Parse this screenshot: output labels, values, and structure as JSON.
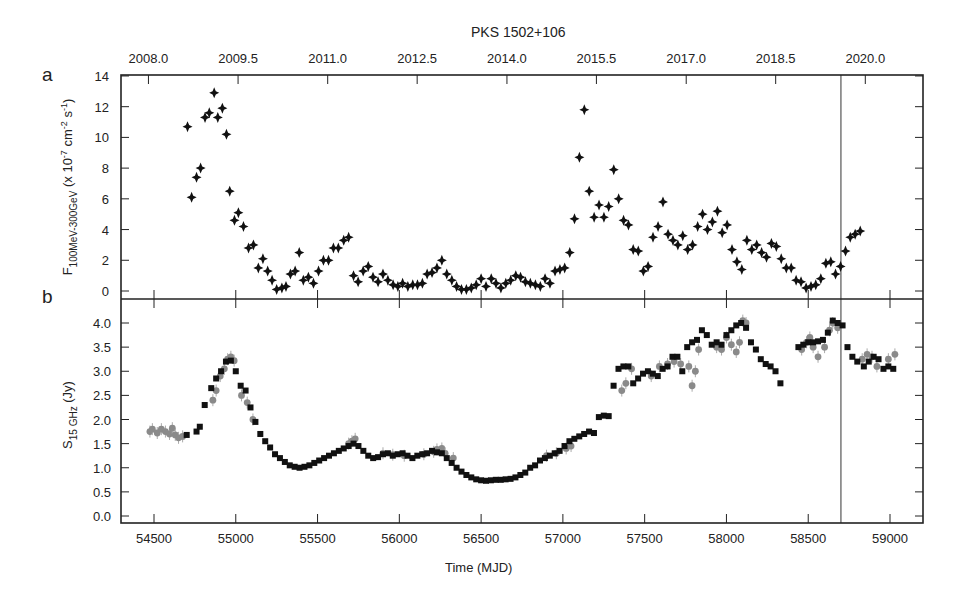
{
  "chart_data": [
    {
      "type": "scatter",
      "panel_label": "a",
      "title": "PKS 1502+106",
      "xlabel": "Time (MJD)",
      "ylabel": "F100MeV-300GeV (x 10^-7 cm^-2 s^-1)",
      "ylabel_main": "F",
      "ylabel_sub": "100MeV-300GeV",
      "ylabel_rest": " (x 10",
      "ylabel_exp1": "-7",
      "ylabel_mid": " cm",
      "ylabel_exp2": "-2",
      "ylabel_mid2": " s",
      "ylabel_exp3": "-1",
      "ylabel_end": ")",
      "ylim": [
        -0.5,
        14
      ],
      "yticks": [
        0,
        2,
        4,
        6,
        8,
        10,
        12,
        14
      ],
      "xlim": [
        54300,
        59220
      ],
      "top_axis_ticks": [
        "2008.0",
        "2009.5",
        "2011.0",
        "2012.5",
        "2014.0",
        "2015.5",
        "2017.0",
        "2018.5",
        "2020.0"
      ],
      "top_axis_tick_mjd": [
        54466,
        55014,
        55562,
        56109,
        56658,
        57205,
        57754,
        58301,
        58849
      ],
      "marker": "four-point star, black",
      "grid": false,
      "vline_mjd": 58700,
      "series": [
        {
          "name": "Fermi-LAT gamma-ray flux",
          "color": "#111111",
          "x": [
            54705,
            54730,
            54760,
            54785,
            54812,
            54838,
            54868,
            54890,
            54918,
            54943,
            54963,
            54992,
            55016,
            55047,
            55078,
            55108,
            55138,
            55166,
            55195,
            55222,
            55250,
            55282,
            55307,
            55334,
            55363,
            55388,
            55413,
            55444,
            55475,
            55506,
            55536,
            55567,
            55597,
            55627,
            55660,
            55690,
            55720,
            55748,
            55779,
            55810,
            55839,
            55870,
            55900,
            55930,
            55962,
            55991,
            56020,
            56052,
            56082,
            56111,
            56141,
            56170,
            56200,
            56230,
            56260,
            56290,
            56321,
            56350,
            56380,
            56410,
            56440,
            56470,
            56500,
            56530,
            56562,
            56591,
            56621,
            56651,
            56681,
            56712,
            56741,
            56771,
            56801,
            56832,
            56862,
            56891,
            56921,
            56952,
            56982,
            57011,
            57042,
            57071,
            57101,
            57131,
            57161,
            57191,
            57221,
            57251,
            57280,
            57311,
            57341,
            57371,
            57401,
            57430,
            57461,
            57492,
            57521,
            57551,
            57582,
            57612,
            57643,
            57673,
            57703,
            57733,
            57763,
            57793,
            57824,
            57854,
            57884,
            57914,
            57945,
            57974,
            58004,
            58034,
            58064,
            58094,
            58125,
            58155,
            58185,
            58215,
            58245,
            58275,
            58305,
            58335,
            58366,
            58396,
            58426,
            58456,
            58487,
            58517,
            58546,
            58577,
            58608,
            58638,
            58667,
            58698,
            58728,
            58757,
            58787,
            58818,
            58849,
            58878,
            58908,
            58938,
            58969,
            58999,
            59029
          ],
          "y": [
            10.7,
            6.1,
            7.4,
            8.0,
            11.3,
            11.6,
            12.9,
            11.3,
            11.9,
            10.2,
            6.5,
            4.6,
            5.1,
            4.2,
            2.8,
            3.0,
            1.5,
            2.1,
            1.3,
            0.7,
            0.1,
            0.2,
            0.3,
            1.1,
            1.3,
            2.5,
            0.7,
            0.9,
            0.5,
            1.3,
            2.0,
            2.0,
            2.8,
            2.8,
            3.3,
            3.5,
            1.0,
            0.6,
            1.3,
            1.6,
            0.9,
            0.6,
            1.1,
            0.7,
            0.4,
            0.3,
            0.5,
            0.3,
            0.4,
            0.4,
            0.5,
            1.1,
            1.2,
            1.5,
            2.0,
            1.1,
            0.7,
            0.3,
            0.1,
            0.1,
            0.2,
            0.4,
            0.8,
            0.3,
            0.8,
            0.5,
            0.2,
            0.5,
            0.7,
            1.0,
            0.9,
            0.6,
            0.5,
            0.4,
            0.3,
            0.8,
            0.5,
            1.3,
            1.4,
            1.5,
            2.5,
            4.7,
            8.7,
            11.8,
            6.5,
            4.8,
            5.6,
            4.8,
            5.5,
            7.9,
            6.0,
            4.6,
            4.3,
            2.7,
            2.6,
            1.3,
            1.6,
            3.5,
            4.2,
            5.8,
            3.7,
            3.3,
            3.0,
            3.6,
            2.7,
            3.0,
            4.2,
            5.0,
            4.0,
            4.5,
            5.2,
            3.8,
            4.3,
            2.7,
            1.9,
            1.4,
            3.3,
            2.7,
            3.0,
            2.5,
            2.2,
            3.1,
            2.9,
            2.1,
            1.5,
            1.5,
            0.7,
            0.6,
            0.2,
            0.3,
            0.4,
            0.8,
            1.8,
            1.9,
            1.1,
            1.6,
            2.6,
            3.5,
            3.7,
            3.9
          ]
        }
      ]
    },
    {
      "type": "scatter",
      "panel_label": "b",
      "xlabel": "Time (MJD)",
      "ylabel": "S15 GHz (Jy)",
      "ylabel_main": "S",
      "ylabel_sub": "15 GHz",
      "ylabel_rest": " (Jy)",
      "ylim": [
        -0.15,
        4.45
      ],
      "yticks": [
        0.0,
        0.5,
        1.0,
        1.5,
        2.0,
        2.5,
        3.0,
        3.5,
        4.0
      ],
      "ytick_labels": [
        "0.0",
        "0.5",
        "1.0",
        "1.5",
        "2.0",
        "2.5",
        "3.0",
        "3.5",
        "4.0"
      ],
      "xlim": [
        54300,
        59220
      ],
      "xticks": [
        54500,
        55000,
        55500,
        56000,
        56500,
        57000,
        57500,
        58000,
        58500,
        59000
      ],
      "marker": "square (black) and circle (grey)",
      "grid": false,
      "vline_mjd": 58700,
      "series": [
        {
          "name": "OVRO 40m (grey circles)",
          "color": "#8a8a8a",
          "x": [
            54475,
            54490,
            54520,
            54545,
            54570,
            54595,
            54612,
            54630,
            54650,
            54675,
            54860,
            54880,
            54905,
            54930,
            54950,
            54970,
            54990,
            55035,
            55070,
            55105,
            55690,
            55710,
            55730,
            55900,
            55960,
            56030,
            56150,
            56210,
            56230,
            56260,
            56280,
            56330,
            56900,
            56960,
            57020,
            57050,
            57360,
            57385,
            57420,
            57540,
            57590,
            57640,
            57680,
            57720,
            57770,
            57790,
            57810,
            57830,
            57940,
            57970,
            58000,
            58030,
            58060,
            58080,
            58100,
            58120,
            58460,
            58490,
            58510,
            58530,
            58560,
            58600,
            58630,
            58650,
            58680,
            58830,
            58860,
            58890,
            58920,
            58990,
            59030
          ],
          "y": [
            1.75,
            1.8,
            1.72,
            1.8,
            1.75,
            1.7,
            1.82,
            1.68,
            1.62,
            1.65,
            2.4,
            2.6,
            2.9,
            3.05,
            3.25,
            3.3,
            3.22,
            2.5,
            2.35,
            2.0,
            1.5,
            1.55,
            1.6,
            1.3,
            1.27,
            1.25,
            1.28,
            1.33,
            1.38,
            1.4,
            1.3,
            1.2,
            1.25,
            1.3,
            1.4,
            1.45,
            2.6,
            2.75,
            3.05,
            2.9,
            3.1,
            3.15,
            3.2,
            3.15,
            3.1,
            2.7,
            3.0,
            3.45,
            3.5,
            3.45,
            3.7,
            3.55,
            3.4,
            3.6,
            4.05,
            4.0,
            3.45,
            3.6,
            3.7,
            3.5,
            3.3,
            3.5,
            3.85,
            4.0,
            3.9,
            3.25,
            3.35,
            3.3,
            3.1,
            3.25,
            3.35
          ]
        },
        {
          "name": "OVRO 40m (black squares)",
          "color": "#111111",
          "x": [
            54700,
            54760,
            54780,
            54810,
            54850,
            54880,
            54910,
            54940,
            54970,
            55000,
            55030,
            55060,
            55090,
            55120,
            55150,
            55180,
            55210,
            55240,
            55270,
            55300,
            55330,
            55360,
            55390,
            55420,
            55450,
            55480,
            55510,
            55540,
            55570,
            55600,
            55630,
            55660,
            55690,
            55720,
            55750,
            55780,
            55810,
            55840,
            55870,
            55900,
            55930,
            55960,
            55990,
            56020,
            56050,
            56080,
            56110,
            56140,
            56170,
            56200,
            56230,
            56260,
            56290,
            56320,
            56350,
            56380,
            56410,
            56440,
            56470,
            56500,
            56530,
            56560,
            56590,
            56620,
            56650,
            56680,
            56710,
            56740,
            56770,
            56800,
            56830,
            56860,
            56890,
            56920,
            56950,
            56980,
            57010,
            57040,
            57070,
            57100,
            57130,
            57160,
            57190,
            57220,
            57250,
            57280,
            57310,
            57340,
            57370,
            57400,
            57430,
            57460,
            57490,
            57520,
            57550,
            57580,
            57610,
            57640,
            57670,
            57700,
            57730,
            57760,
            57790,
            57820,
            57850,
            57880,
            57910,
            57940,
            57970,
            58000,
            58030,
            58060,
            58090,
            58120,
            58150,
            58180,
            58210,
            58240,
            58270,
            58300,
            58330,
            58440,
            58470,
            58500,
            58530,
            58560,
            58590,
            58620,
            58650,
            58680,
            58710,
            58740,
            58770,
            58800,
            58840,
            58870,
            58900,
            58930,
            58960,
            58990,
            59020
          ],
          "y": [
            1.68,
            1.75,
            1.85,
            2.3,
            2.65,
            2.85,
            3.0,
            3.2,
            3.22,
            3.0,
            2.7,
            2.6,
            2.25,
            1.95,
            1.7,
            1.55,
            1.42,
            1.28,
            1.2,
            1.12,
            1.05,
            1.02,
            1.0,
            1.02,
            1.05,
            1.1,
            1.15,
            1.2,
            1.25,
            1.3,
            1.35,
            1.4,
            1.45,
            1.5,
            1.45,
            1.35,
            1.25,
            1.2,
            1.22,
            1.28,
            1.3,
            1.25,
            1.28,
            1.3,
            1.25,
            1.2,
            1.25,
            1.28,
            1.3,
            1.35,
            1.32,
            1.3,
            1.2,
            1.1,
            1.0,
            0.92,
            0.85,
            0.8,
            0.76,
            0.74,
            0.73,
            0.74,
            0.75,
            0.75,
            0.76,
            0.77,
            0.8,
            0.85,
            0.9,
            1.0,
            1.05,
            1.15,
            1.2,
            1.25,
            1.3,
            1.35,
            1.45,
            1.55,
            1.6,
            1.65,
            1.7,
            1.75,
            1.72,
            2.05,
            2.08,
            2.07,
            2.7,
            3.05,
            3.1,
            3.1,
            2.75,
            2.85,
            2.95,
            3.0,
            2.95,
            2.9,
            3.05,
            3.1,
            3.3,
            3.3,
            3.0,
            3.5,
            3.6,
            3.65,
            3.85,
            3.75,
            3.55,
            3.6,
            3.55,
            3.75,
            3.85,
            3.95,
            4.0,
            3.9,
            3.6,
            3.45,
            3.25,
            3.15,
            3.1,
            3.0,
            2.75,
            3.5,
            3.55,
            3.6,
            3.6,
            3.62,
            3.65,
            3.8,
            4.05,
            4.0,
            3.95,
            3.5,
            3.3,
            3.2,
            3.1,
            3.2,
            3.3,
            3.25,
            3.05,
            3.1,
            3.05,
            3.2,
            3.3
          ]
        }
      ]
    }
  ],
  "labels": {
    "title": "PKS 1502+106",
    "panel_a": "a",
    "panel_b": "b",
    "xlabel": "Time (MJD)"
  }
}
